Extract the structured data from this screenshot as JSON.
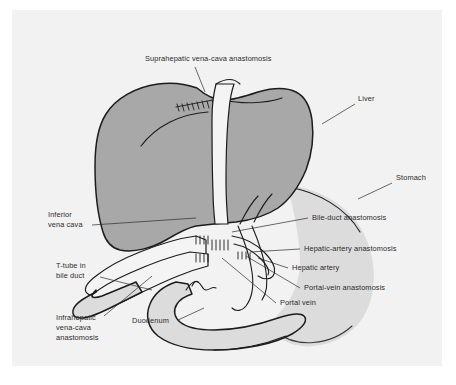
{
  "figure": {
    "background_color": "#f2f2f2",
    "page_color": "#ffffff",
    "colors": {
      "liver_fill": "#a8a8a8",
      "stomach_fill": "#dcdcdc",
      "vessel_fill": "#f4f4f4",
      "outline": "#1c1c1c",
      "label_text": "#2b2b2b",
      "leader_line": "#2b2b2b"
    }
  },
  "labels": {
    "suprahepatic": {
      "lines": [
        "Suprahepatic vena-cava anastomosis"
      ],
      "anchor": "suprahepatic-vena-cava-anastomosis"
    },
    "liver": {
      "lines": [
        "Liver"
      ],
      "anchor": "liver"
    },
    "stomach": {
      "lines": [
        "Stomach"
      ],
      "anchor": "stomach"
    },
    "inferior_vena_cava": {
      "lines": [
        "Inferior",
        "vena cava"
      ],
      "anchor": "inferior-vena-cava"
    },
    "bile_duct_anastomosis": {
      "lines": [
        "Bile-duct anastomosis"
      ],
      "anchor": "bile-duct-anastomosis"
    },
    "hepatic_artery_anastomosis": {
      "lines": [
        "Hepatic-artery anastomosis"
      ],
      "anchor": "hepatic-artery-anastomosis"
    },
    "hepatic_artery": {
      "lines": [
        "Hepatic artery"
      ],
      "anchor": "hepatic-artery"
    },
    "portal_vein_anastomosis": {
      "lines": [
        "Portal-vein anastomosis"
      ],
      "anchor": "portal-vein-anastomosis"
    },
    "portal_vein": {
      "lines": [
        "Portal vein"
      ],
      "anchor": "portal-vein"
    },
    "t_tube": {
      "lines": [
        "T-tube in",
        "bile duct"
      ],
      "anchor": "t-tube-in-bile-duct"
    },
    "infrahepatic": {
      "lines": [
        "Infrahepatic",
        "vena-cava",
        "anastomosis"
      ],
      "anchor": "infrahepatic-vena-cava-anastomosis"
    },
    "duodenum": {
      "lines": [
        "Duodenum"
      ],
      "anchor": "duodenum"
    }
  }
}
